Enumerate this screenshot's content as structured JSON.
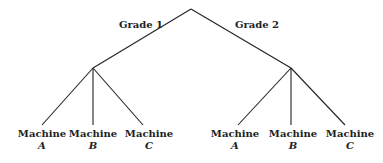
{
  "tree": {
    "root": {
      "x": 191,
      "y": 9
    },
    "branches": [
      {
        "label": "Grade 1",
        "label_pos": {
          "x": 141,
          "y": 25
        },
        "node": {
          "x": 93,
          "y": 68
        },
        "leaves": [
          {
            "line": "Machine",
            "var": "A",
            "end": {
              "x": 42,
              "y": 125
            }
          },
          {
            "line": "Machine",
            "var": "B",
            "end": {
              "x": 93,
              "y": 125
            }
          },
          {
            "line": "Machine",
            "var": "C",
            "end": {
              "x": 143,
              "y": 125
            }
          }
        ]
      },
      {
        "label": "Grade 2",
        "label_pos": {
          "x": 257,
          "y": 25
        },
        "node": {
          "x": 291,
          "y": 68
        },
        "leaves": [
          {
            "line": "Machine",
            "var": "A",
            "end": {
              "x": 238,
              "y": 125
            }
          },
          {
            "line": "Machine",
            "var": "B",
            "end": {
              "x": 291,
              "y": 125
            }
          },
          {
            "line": "Machine",
            "var": "C",
            "end": {
              "x": 345,
              "y": 125
            }
          }
        ]
      }
    ],
    "line_color": "#222222"
  }
}
